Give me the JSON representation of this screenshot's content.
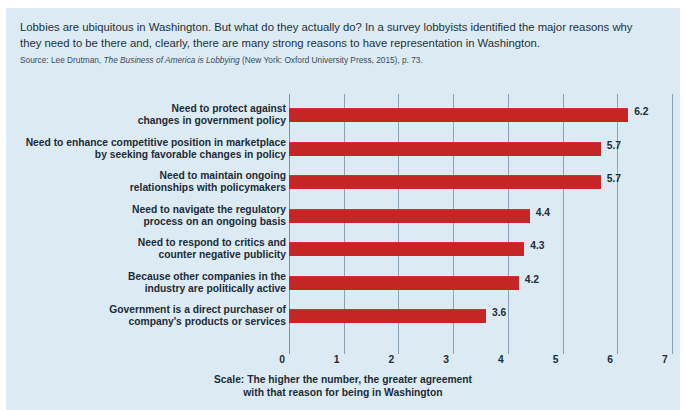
{
  "figure": {
    "intro": "Lobbies are ubiquitous in Washington. But what do they actually do? In a survey lobbyists identified the major reasons why they need to be there and, clearly, there are many strong reasons to have representation in Washington.",
    "source_prefix": "Source: Lee Drutman, ",
    "source_italic": "The Business of America is Lobbying",
    "source_suffix": " (New York: Oxford University Press, 2015), p. 73.",
    "scale_caption_line1": "Scale: The higher the number, the greater agreement",
    "scale_caption_line2": "with that reason for being in Washington",
    "bar_color": "#c62526",
    "panel_color": "#dceaf3",
    "grid_color": "#8aa2b3"
  },
  "chart_data": {
    "type": "bar",
    "orientation": "horizontal",
    "title": "",
    "xlabel": "Scale: The higher the number, the greater agreement with that reason for being in Washington",
    "ylabel": "",
    "xlim": [
      0,
      7
    ],
    "xticks": [
      "0",
      "1",
      "2",
      "3",
      "4",
      "5",
      "6",
      "7"
    ],
    "grid": true,
    "legend": "none",
    "categories": [
      "Need to protect against changes in government policy",
      "Need to enhance competitive position in marketplace by seeking favorable changes in policy",
      "Need to maintain ongoing relationships with policymakers",
      "Need to navigate the regulatory process on an ongoing basis",
      "Need to respond to critics and counter negative publicity",
      "Because other companies in the industry are politically active",
      "Government is a direct purchaser of company's products or services"
    ],
    "category_lines": [
      [
        "Need to protect against",
        "changes in government policy"
      ],
      [
        "Need to enhance competitive position in marketplace",
        "by seeking favorable changes in policy"
      ],
      [
        "Need to maintain ongoing",
        "relationships with policymakers"
      ],
      [
        "Need to navigate the regulatory",
        "process on an ongoing basis"
      ],
      [
        "Need to respond to critics and",
        "counter negative publicity"
      ],
      [
        "Because other companies in the",
        "industry are politically active"
      ],
      [
        "Government is a direct purchaser of",
        "company's products or services"
      ]
    ],
    "values": [
      6.2,
      5.7,
      5.7,
      4.4,
      4.3,
      4.2,
      3.6
    ],
    "value_labels": [
      "6.2",
      "5.7",
      "5.7",
      "4.4",
      "4.3",
      "4.2",
      "3.6"
    ]
  }
}
